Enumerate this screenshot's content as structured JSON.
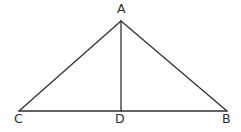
{
  "figure": {
    "kind": "geometry-diagram",
    "background_color": "#ffffff",
    "stroke_color": "#313131",
    "stroke_width": 1.3,
    "label_color": "#2b2b2b",
    "label_font_size": "12.5px",
    "canvas": {
      "width": 241,
      "height": 132
    }
  },
  "points": {
    "A": {
      "label": "A",
      "x": 121,
      "y": 21
    },
    "B": {
      "label": "B",
      "x": 227,
      "y": 111
    },
    "C": {
      "label": "C",
      "x": 19,
      "y": 111
    },
    "D": {
      "label": "D",
      "x": 121,
      "y": 111
    }
  },
  "segments": [
    {
      "name": "side-CA",
      "from": "C",
      "to": "A",
      "d": "M 19 111 L 121 21"
    },
    {
      "name": "side-AB",
      "from": "A",
      "to": "B",
      "d": "M 121 21 L 227 111"
    },
    {
      "name": "base-CB",
      "from": "C",
      "to": "B",
      "d": "M 19 111 L 227 111"
    },
    {
      "name": "altitude-AD",
      "from": "A",
      "to": "D",
      "d": "M 121 21 L 121 111"
    }
  ],
  "labels": {
    "A": "A",
    "B": "B",
    "C": "C",
    "D": "D"
  }
}
